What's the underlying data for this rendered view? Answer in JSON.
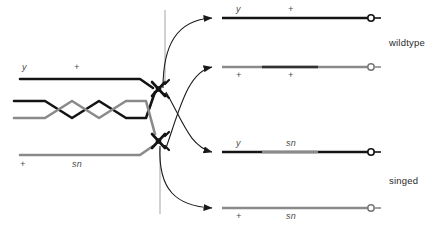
{
  "figure": {
    "type": "genetics-crossover-diagram"
  },
  "colors": {
    "dark_chromatid": "#141414",
    "gray_chromatid": "#8a8a8a",
    "arrow": "#1a1a1a",
    "text": "#4a4a4a",
    "background": "#ffffff"
  },
  "left": {
    "chromatids": [
      {
        "id": "chromatid-1",
        "shade": "dark",
        "alleles": [
          "y",
          "+"
        ],
        "label_position": "above"
      },
      {
        "id": "chromatid-2",
        "shade": "dark",
        "alleles": [],
        "label_position": "none"
      },
      {
        "id": "chromatid-3",
        "shade": "gray",
        "alleles": [],
        "label_position": "none"
      },
      {
        "id": "chromatid-4",
        "shade": "gray",
        "alleles": [
          "+",
          "sn"
        ],
        "label_position": "below"
      }
    ],
    "labels": {
      "top_allele_1": "y",
      "top_allele_2": "+",
      "bottom_allele_1": "+",
      "bottom_allele_2": "sn"
    }
  },
  "products": [
    {
      "id": "product-1",
      "shade": "dark",
      "alleles": [
        "y",
        "+"
      ],
      "label_position": "above",
      "phenotype": "wildtype"
    },
    {
      "id": "product-2",
      "shade": "gray",
      "alleles": [
        "+",
        "+"
      ],
      "label_position": "below",
      "phenotype": "wildtype"
    },
    {
      "id": "product-3",
      "shade": "mixed",
      "alleles": [
        "y",
        "sn"
      ],
      "label_position": "above",
      "phenotype": "singed"
    },
    {
      "id": "product-4",
      "shade": "gray",
      "alleles": [
        "+",
        "sn"
      ],
      "label_position": "below",
      "phenotype": "singed"
    }
  ],
  "phenotypes": {
    "top": "wildtype",
    "bottom": "singed"
  },
  "icons": {
    "centromere": "centromere-icon",
    "telomere_circle": "telomere-circle-icon",
    "arrow": "arrow-icon"
  }
}
